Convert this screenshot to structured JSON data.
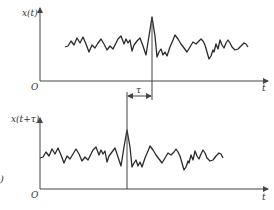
{
  "figure": {
    "top_panel": {
      "y_label": "x(t)",
      "x_label": "t",
      "origin_label": "O",
      "peak_x": 152
    },
    "bottom_panel": {
      "y_label": "x(t+τ)",
      "x_label": "t",
      "origin_label": "O",
      "peak_x": 127
    },
    "shift": {
      "label": "τ"
    },
    "subfigure_label": ")"
  },
  "colors": {
    "line": "#2a2a2a",
    "axis": "#444444",
    "background": "#ffffff"
  }
}
